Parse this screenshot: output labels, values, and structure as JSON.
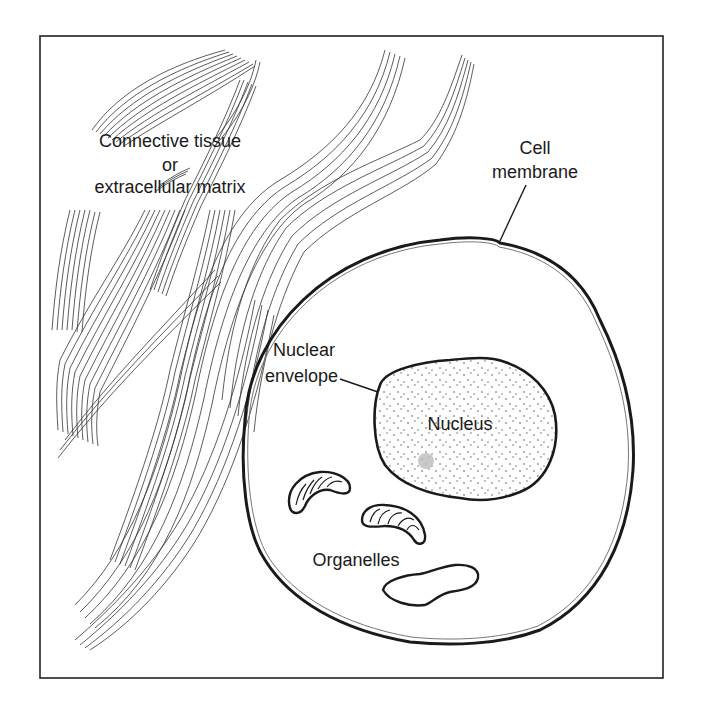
{
  "diagram": {
    "labels": {
      "connective_tissue_line1": "Connective tissue",
      "connective_tissue_line2": "or",
      "connective_tissue_line3": "extracellular matrix",
      "cell_membrane_line1": "Cell",
      "cell_membrane_line2": "membrane",
      "nuclear_envelope_line1": "Nuclear",
      "nuclear_envelope_line2": "envelope",
      "nucleus": "Nucleus",
      "organelles": "Organelles"
    },
    "parts": [
      {
        "name": "connective-tissue",
        "label": "Connective tissue or extracellular matrix"
      },
      {
        "name": "cell-membrane",
        "label": "Cell membrane"
      },
      {
        "name": "nuclear-envelope",
        "label": "Nuclear envelope"
      },
      {
        "name": "nucleus",
        "label": "Nucleus"
      },
      {
        "name": "organelles",
        "label": "Organelles",
        "items": [
          "mitochondrion",
          "mitochondrion",
          "vesicle"
        ]
      }
    ],
    "colors": {
      "line": "#1a1a1a",
      "background": "#ffffff",
      "stipple": "#555555",
      "nucleolus": "#b0b0b0"
    }
  }
}
